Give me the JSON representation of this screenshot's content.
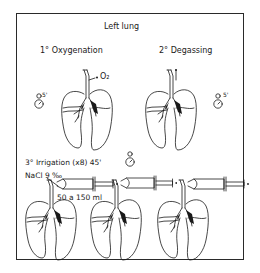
{
  "title": "Left   lung",
  "steps": [
    {
      "label": "1° Oxygenation",
      "duration": "5'",
      "gas": "O₂"
    },
    {
      "label": "2° Degassing",
      "duration": "5'"
    },
    {
      "label": "3° Irrigation (x8)  45'",
      "solution": "NaCl  9 ‰",
      "volume": "50 a 150 ml"
    }
  ],
  "icons": {
    "clock": "stopwatch-icon",
    "syringe": "syringe-icon",
    "lung": "lungs-icon"
  },
  "colors": {
    "line": "#1a1a1a",
    "background": "#ffffff"
  }
}
